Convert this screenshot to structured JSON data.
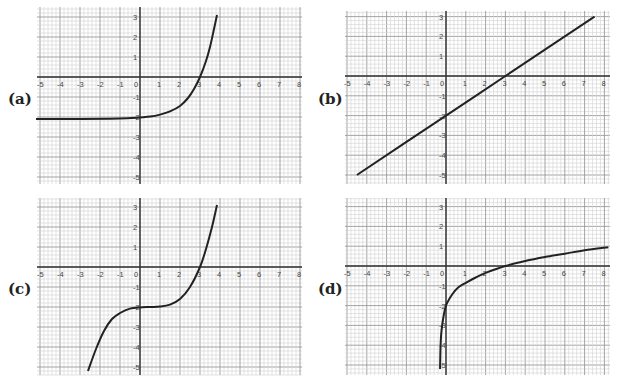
{
  "chart_data": [
    {
      "type": "line",
      "label": "(a)",
      "title": "",
      "xlabel": "",
      "ylabel": "",
      "xlim": [
        -5,
        8
      ],
      "ylim": [
        -5,
        3
      ],
      "grid": true,
      "minor_grid_step": 0.2,
      "xticks": [
        -5,
        -4,
        -3,
        -2,
        -1,
        0,
        1,
        2,
        3,
        4,
        5,
        6,
        7,
        8
      ],
      "yticks": [
        3,
        2,
        1,
        -1,
        -2,
        -3,
        -4,
        -5
      ],
      "description": "exponential growth curve, horizontal asymptote y≈-2.1, passes (0,-2), (3,0)",
      "points": [
        [
          -5.2,
          -2.1
        ],
        [
          -3,
          -2.1
        ],
        [
          -1,
          -2.08
        ],
        [
          0,
          -2.02
        ],
        [
          0.5,
          -1.98
        ],
        [
          1,
          -1.88
        ],
        [
          1.5,
          -1.72
        ],
        [
          2,
          -1.45
        ],
        [
          2.4,
          -1.05
        ],
        [
          2.7,
          -0.6
        ],
        [
          3,
          0
        ],
        [
          3.3,
          0.8
        ],
        [
          3.5,
          1.5
        ],
        [
          3.7,
          2.4
        ],
        [
          3.85,
          3.1
        ]
      ],
      "color": "#222222"
    },
    {
      "type": "line",
      "label": "(b)",
      "title": "",
      "xlabel": "",
      "ylabel": "",
      "xlim": [
        -5,
        8
      ],
      "ylim": [
        -5,
        3
      ],
      "grid": true,
      "minor_grid_step": 0.2,
      "xticks": [
        -5,
        -4,
        -3,
        -2,
        -1,
        0,
        1,
        2,
        3,
        4,
        5,
        6,
        7,
        8
      ],
      "yticks": [
        3,
        2,
        1,
        -1,
        -2,
        -3,
        -4,
        -5
      ],
      "description": "straight line, slope 2/3, y-intercept -2, x-intercept 3",
      "points": [
        [
          -4.5,
          -5
        ],
        [
          0,
          -2
        ],
        [
          3,
          0
        ],
        [
          7.5,
          3
        ]
      ],
      "color": "#222222"
    },
    {
      "type": "line",
      "label": "(c)",
      "title": "",
      "xlabel": "",
      "ylabel": "",
      "xlim": [
        -5,
        8
      ],
      "ylim": [
        -5,
        3
      ],
      "grid": true,
      "minor_grid_step": 0.2,
      "xticks": [
        -5,
        -4,
        -3,
        -2,
        -1,
        0,
        1,
        2,
        3,
        4,
        5,
        6,
        7,
        8
      ],
      "yticks": [
        3,
        2,
        1,
        -1,
        -2,
        -3,
        -4,
        -5
      ],
      "description": "cubic curve with flat inflection near (0.5,-2), passes (3,0)",
      "points": [
        [
          -2.6,
          -5.2
        ],
        [
          -2.2,
          -4.1
        ],
        [
          -1.8,
          -3.2
        ],
        [
          -1.4,
          -2.6
        ],
        [
          -1,
          -2.3
        ],
        [
          -0.5,
          -2.08
        ],
        [
          0,
          -2.02
        ],
        [
          0.5,
          -2.0
        ],
        [
          1,
          -1.98
        ],
        [
          1.5,
          -1.88
        ],
        [
          2,
          -1.6
        ],
        [
          2.5,
          -1.0
        ],
        [
          3,
          0
        ],
        [
          3.3,
          0.9
        ],
        [
          3.6,
          2.0
        ],
        [
          3.85,
          3.1
        ]
      ],
      "color": "#222222"
    },
    {
      "type": "line",
      "label": "(d)",
      "title": "",
      "xlabel": "",
      "ylabel": "",
      "xlim": [
        -5,
        8
      ],
      "ylim": [
        -5,
        3
      ],
      "grid": true,
      "minor_grid_step": 0.2,
      "xticks": [
        -5,
        -4,
        -3,
        -2,
        -1,
        0,
        1,
        2,
        3,
        4,
        5,
        6,
        7,
        8
      ],
      "yticks": [
        3,
        2,
        1,
        -1,
        -2,
        -3,
        -4,
        -5
      ],
      "description": "logarithmic curve, vertical asymptote near x≈-0.3, passes (0,-2), (3,0), (8,0.95)",
      "points": [
        [
          -0.3,
          -5.2
        ],
        [
          -0.28,
          -4.2
        ],
        [
          -0.24,
          -3.4
        ],
        [
          -0.15,
          -2.7
        ],
        [
          0,
          -2.0
        ],
        [
          0.3,
          -1.45
        ],
        [
          0.6,
          -1.1
        ],
        [
          1,
          -0.85
        ],
        [
          1.5,
          -0.58
        ],
        [
          2,
          -0.35
        ],
        [
          3,
          0
        ],
        [
          4,
          0.25
        ],
        [
          5,
          0.45
        ],
        [
          6,
          0.62
        ],
        [
          7,
          0.8
        ],
        [
          8.2,
          0.95
        ]
      ],
      "color": "#222222"
    }
  ],
  "panels": [
    {
      "label": "(a)",
      "left": 0,
      "top": 0,
      "grid": {
        "x0": 37,
        "y0": 7,
        "x1": 302,
        "y1": 184
      },
      "origin": [
        140,
        77
      ],
      "unit": 20
    },
    {
      "label": "(b)",
      "left": 310,
      "top": 0,
      "grid": {
        "x0": 35,
        "y0": 11,
        "x1": 300,
        "y1": 184
      },
      "origin": [
        136,
        76
      ],
      "unit": 19.8
    },
    {
      "label": "(c)",
      "left": 0,
      "top": 191,
      "grid": {
        "x0": 37,
        "y0": 7,
        "x1": 302,
        "y1": 184
      },
      "origin": [
        140,
        76
      ],
      "unit": 20
    },
    {
      "label": "(d)",
      "left": 310,
      "top": 191,
      "grid": {
        "x0": 35,
        "y0": 7,
        "x1": 300,
        "y1": 184
      },
      "origin": [
        136,
        75
      ],
      "unit": 19.8
    }
  ]
}
